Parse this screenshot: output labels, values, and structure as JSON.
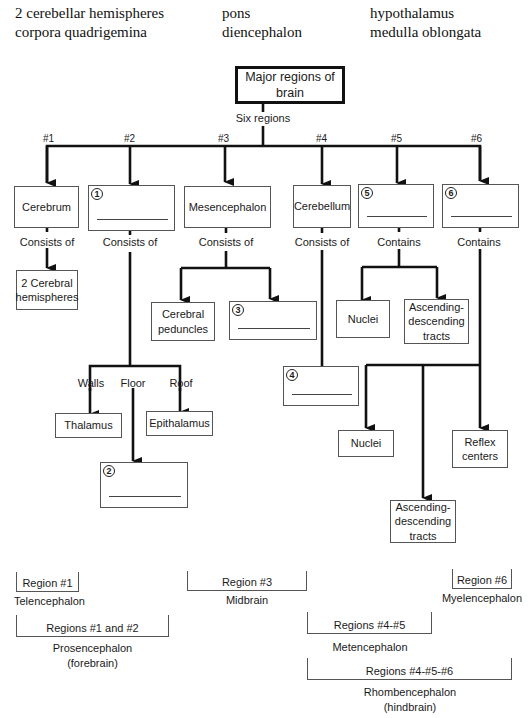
{
  "word_bank": [
    "2 cerebellar hemispheres",
    "pons",
    "hypothalamus",
    "corpora quadrigemina",
    "diencephalon",
    "medulla oblongata"
  ],
  "root": {
    "label": "Major regions of brain",
    "edge_label": "Six regions"
  },
  "regions": [
    {
      "num": "#1",
      "name": "Cerebrum",
      "relation": "Consists of"
    },
    {
      "num": "#2",
      "blank": "1",
      "relation": "Consists of"
    },
    {
      "num": "#3",
      "name": "Mesencephalon",
      "relation": "Consists of"
    },
    {
      "num": "#4",
      "name": "Cerebellum",
      "relation": "Consists of"
    },
    {
      "num": "#5",
      "blank": "5",
      "relation": "Contains"
    },
    {
      "num": "#6",
      "blank": "6",
      "relation": "Contains"
    }
  ],
  "children": {
    "r1": [
      "2 Cerebral hemispheres"
    ],
    "r2": {
      "walls": "Walls",
      "floor": "Floor",
      "roof": "Roof",
      "thalamus": "Thalamus",
      "epithalamus": "Epithalamus",
      "floor_blank": "2"
    },
    "r3": {
      "peduncles": "Cerebral peduncles",
      "blank": "3"
    },
    "r4": {
      "blank": "4"
    },
    "r5": {
      "nuclei": "Nuclei",
      "tracts": "Ascending-descending tracts"
    },
    "r6": {
      "nuclei": "Nuclei",
      "tracts": "Ascending-descending tracts",
      "reflex": "Reflex centers"
    }
  },
  "groupings": [
    {
      "bracket": "Region #1",
      "caption": "Telencephalon"
    },
    {
      "bracket": "Region #3",
      "caption": "Midbrain"
    },
    {
      "bracket": "Region #6",
      "caption": "Myelencephalon"
    },
    {
      "bracket": "Regions #1 and #2",
      "caption": "Prosencephalon (forebrain)"
    },
    {
      "bracket": "Regions #4-#5",
      "caption": "Metencephalon"
    },
    {
      "bracket": "Regions #4-#5-#6",
      "caption": "Rhombencephalon (hindbrain)"
    }
  ]
}
